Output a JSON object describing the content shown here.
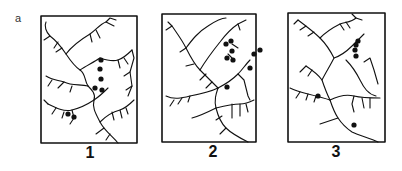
{
  "figure": {
    "panel_letter": "a",
    "colors": {
      "ink": "#111111",
      "background": "#ffffff"
    },
    "maps": [
      {
        "label": "1",
        "dot_count": 7
      },
      {
        "label": "2",
        "dot_count": 9
      },
      {
        "label": "3",
        "dot_count": 6
      }
    ]
  }
}
